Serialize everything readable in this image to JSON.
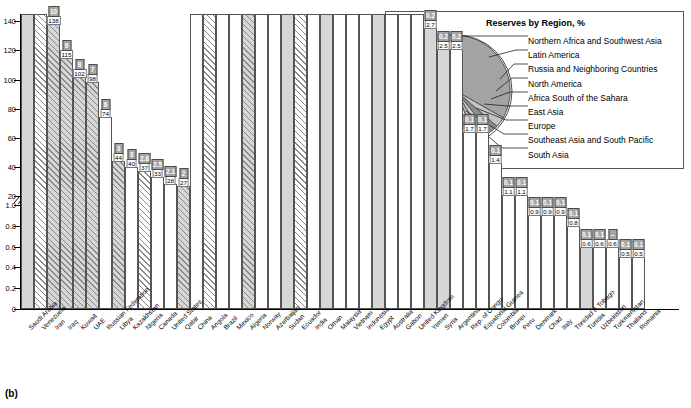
{
  "figure_label": "(b)",
  "title": {
    "main": "Estimated Proven Reserves of Oil",
    "sub": "at end 2009, billion barrels"
  },
  "legend": {
    "items": [
      {
        "swatch": "light-square-swatch",
        "label": "Northern Africa and\nSouthwestern Asia"
      },
      {
        "swatch": "dark-square-swatch",
        "label": "Percentage of\nworld reserves"
      },
      {
        "swatch": "hatched-square-swatch",
        "label": "Member of OPEC"
      }
    ]
  },
  "pie_panel": {
    "title": "Reserves by Region, %",
    "labels": [
      "Northern Africa and Southwest Asia",
      "Latin America",
      "Russia and Neighboring Countries",
      "North America",
      "Africa South of the Sahara",
      "East Asia",
      "Europe",
      "Southeast Asia and South Pacific",
      "South Asia"
    ]
  },
  "chart_data": {
    "type": "bar",
    "title": "Estimated Proven Reserves of Oil",
    "subtitle": "at end 2009, billion barrels",
    "xlabel": "",
    "ylabel": "billion barrels",
    "axis_break": true,
    "ticks_upper": [
      "20",
      "40",
      "60",
      "80",
      "100",
      "120",
      "140"
    ],
    "ticks_lower": [
      "0",
      "0.2",
      "0.4",
      "0.6",
      "0.8",
      "1.0"
    ],
    "ylim_upper": [
      0,
      145
    ],
    "ylim_lower": [
      0,
      1.0
    ],
    "grid": false,
    "categories": [
      "Saudi Arabia",
      "Venezuela",
      "Iran",
      "Iraq",
      "Kuwait",
      "UAE",
      "Russian Federation",
      "Libya",
      "Kazakhstan",
      "Nigeria",
      "Canada",
      "United States",
      "Qatar",
      "China",
      "Angola",
      "Brazil",
      "Mexico",
      "Algeria",
      "Norway",
      "Azerbaijan",
      "Sudan",
      "Ecuador",
      "India",
      "Oman",
      "Malaysia",
      "Vietnam",
      "Indonesia",
      "Egypt",
      "Australia",
      "Gabon",
      "United Kingdom",
      "Yemen",
      "Syria",
      "Argentina",
      "Rep. of Congo",
      "Equatorial Guinea",
      "Colombia",
      "Brunei",
      "Peru",
      "Denmark",
      "Chad",
      "Italy",
      "Trinidad & Tobago",
      "Tunisia",
      "Uzbekistan",
      "Turkmenistan",
      "Thailand",
      "Romania"
    ],
    "series": [
      {
        "name": "Proven reserves, billion barrels",
        "values": [
          265,
          172,
          138,
          115,
          102,
          98,
          74,
          44,
          40,
          37,
          33,
          28,
          27,
          15,
          14,
          13,
          12,
          12,
          7,
          7,
          6.7,
          6.5,
          5.8,
          5.6,
          5.5,
          4.5,
          4.4,
          4.4,
          4.2,
          3.7,
          3.1,
          2.7,
          2.5,
          2.5,
          1.7,
          1.7,
          1.4,
          1.1,
          1.1,
          0.9,
          0.9,
          0.9,
          0.8,
          0.6,
          0.6,
          0.6,
          0.5,
          0.5
        ]
      },
      {
        "name": "Percentage of world reserves",
        "values": [
          "20",
          "13",
          "10",
          "9",
          "8",
          "7",
          "6",
          "3",
          "3",
          "2.8",
          "2.5",
          "2.1",
          "2",
          "1",
          "1",
          "1",
          "0.9",
          "0.9",
          "0.5",
          "0.5",
          "0.5",
          "0.5",
          "0.4",
          "0.4",
          "0.4",
          "0.3",
          "0.3",
          "0.3",
          "0.3",
          "0.3",
          "0.2",
          "0.2",
          "0.2",
          "0.2",
          "0.1",
          "0.1",
          "0.1",
          "0.1",
          "0.1",
          "0.1",
          "0.1",
          "0.1",
          "0.1",
          "0.1",
          "0.1",
          "–",
          "0.1",
          "0.1"
        ]
      }
    ],
    "opec_members": [
      "Venezuela",
      "Iran",
      "Iraq",
      "Kuwait",
      "UAE",
      "Libya",
      "Nigeria",
      "Qatar",
      "Angola",
      "Algeria",
      "Ecuador"
    ],
    "northern_africa_southwest_asia": [
      "Saudi Arabia",
      "Iran",
      "Iraq",
      "Kuwait",
      "UAE",
      "Libya",
      "Qatar",
      "Algeria",
      "Sudan",
      "Oman",
      "Egypt",
      "Yemen",
      "Syria",
      "Tunisia"
    ]
  }
}
